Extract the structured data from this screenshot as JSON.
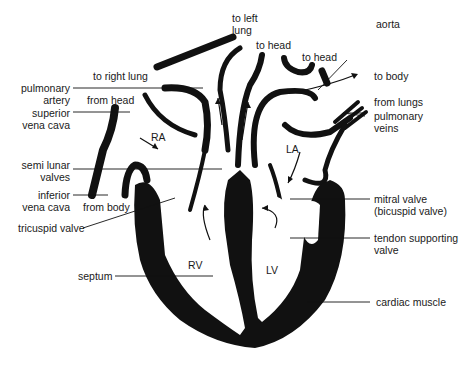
{
  "diagram": {
    "colors": {
      "ink": "#111111",
      "background": "#ffffff",
      "text": "#1a1a1a"
    },
    "labels": {
      "to_left_lung": "to left\nlung",
      "to_head_1": "to head",
      "to_head_2": "to head",
      "aorta": "aorta",
      "to_right_lung": "to right lung",
      "to_body": "to body",
      "pulmonary_artery": "pulmonary\nartery",
      "from_head": "from head",
      "from_lungs": "from lungs",
      "superior_vena_cava": "superior\nvena cava",
      "pulmonary_veins": "pulmonary\nveins",
      "ra": "RA",
      "la": "LA",
      "semi_lunar_valves": "semi lunar\nvalves",
      "inferior_vena_cava": "inferior\nvena cava",
      "from_body": "from body",
      "mitral_valve": "mitral valve\n(bicuspid valve)",
      "tricuspid_valve": "tricuspid valve",
      "tendon_supporting_valve": "tendon supporting\nvalve",
      "rv": "RV",
      "lv": "LV",
      "septum": "septum",
      "cardiac_muscle": "cardiac muscle"
    }
  }
}
